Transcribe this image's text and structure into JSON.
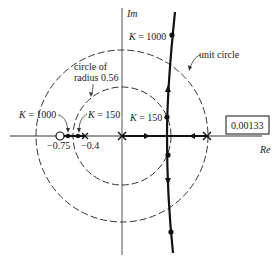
{
  "diagram": {
    "type": "root-locus",
    "axes": {
      "imag_label": "Im",
      "real_label": "Re"
    },
    "labels": {
      "k_top": "K = 1000",
      "k_mid": "K = 150",
      "k_left_1000": "K = 1000",
      "k_left_150": "K = 150",
      "circle_small_line1": "circle of",
      "circle_small_line2": "radius 0.56",
      "unit_circle": "unit circle",
      "tick_075": "−0.75",
      "tick_04": "−0.4",
      "box_value": "0.00133"
    },
    "colors": {
      "ink": "#1a1a1a",
      "axis": "#555555",
      "background": "#ffffff"
    }
  }
}
